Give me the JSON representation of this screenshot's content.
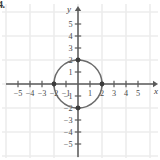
{
  "figure": {
    "problem_label": "4.",
    "background_color": "#ffffff",
    "axis_color": "#5a5a5a",
    "grid_color": "#ededed",
    "curve_color": "#6b6b6b",
    "point_color": "#3c3c3c"
  },
  "chart_data": {
    "type": "scatter",
    "title": "",
    "xlabel": "x",
    "ylabel": "y",
    "xlim": [
      -6,
      6
    ],
    "ylim": [
      -6,
      6
    ],
    "grid": true,
    "grid_step": 2,
    "unit_px": 12,
    "origin_px": [
      78,
      84
    ],
    "legend": "none",
    "xticks": [
      -5,
      -4,
      -3,
      -2,
      -1,
      1,
      2,
      3,
      4,
      5
    ],
    "xticklabels": [
      "−5",
      "−4",
      "−3",
      "−2",
      "−1",
      "1",
      "2",
      "3",
      "4",
      "5"
    ],
    "yticks": [
      5,
      4,
      3,
      2,
      1,
      -1,
      -2,
      -3,
      -4,
      -5
    ],
    "yticklabels": [
      "5",
      "4",
      "3",
      "2",
      "1",
      "−1",
      "−2",
      "−3",
      "−4",
      "−5"
    ],
    "series": [
      {
        "name": "circle",
        "type": "circle",
        "center": [
          0,
          0
        ],
        "radius": 2,
        "equation": "x^2 + y^2 = 4"
      },
      {
        "name": "marked-points",
        "type": "points",
        "x": [
          0,
          2,
          0,
          -2
        ],
        "y": [
          2,
          0,
          -2,
          0
        ],
        "labels": [
          "(0, 2)",
          "(2, 0)",
          "(0, -2)",
          "(-2, 0)"
        ]
      }
    ]
  }
}
